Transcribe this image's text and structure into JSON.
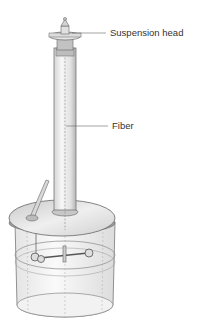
{
  "diagram": {
    "labels": {
      "suspension_head": "Suspension head",
      "fiber": "Fiber"
    },
    "colors": {
      "line": "#555555",
      "fill_light": "#eeeeee",
      "fill_mid": "#cfcfcf",
      "fill_dark": "#9a9a9a",
      "text": "#333333"
    }
  }
}
